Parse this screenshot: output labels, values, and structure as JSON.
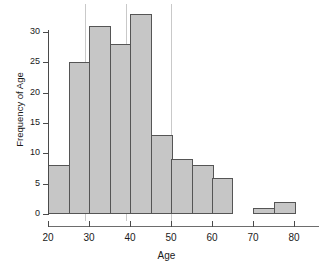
{
  "chart_data": {
    "type": "bar",
    "title": "",
    "subtitle": "",
    "xlabel": "Age",
    "ylabel": "Frequency of Age",
    "xlim": [
      20,
      80
    ],
    "ylim": [
      0,
      33
    ],
    "bin_width": 5,
    "grid": false,
    "legend": null,
    "bar_color": "#c6c6c6",
    "bar_edge_color": "#555555",
    "axis_color": "#4a4a4a",
    "gridline_color": "#c9c9c9",
    "categories": [
      "20-25",
      "25-30",
      "30-35",
      "35-40",
      "40-45",
      "45-50",
      "50-55",
      "55-60",
      "60-65",
      "65-70",
      "70-75",
      "75-80"
    ],
    "bin_edges": [
      20,
      25,
      30,
      35,
      40,
      45,
      50,
      55,
      60,
      65,
      70,
      75,
      80
    ],
    "values": [
      8,
      25,
      31,
      28,
      33,
      13,
      9,
      8,
      6,
      0,
      1,
      2
    ],
    "x_ticks": [
      20,
      30,
      40,
      50,
      60,
      70,
      80
    ],
    "x_tick_labels": [
      "20",
      "30",
      "40",
      "50",
      "60",
      "70",
      "80"
    ],
    "y_ticks": [
      0,
      5,
      10,
      15,
      20,
      25,
      30
    ],
    "y_tick_labels": [
      "0",
      "5",
      "10",
      "15",
      "20",
      "25",
      "30"
    ],
    "vertical_reference_lines": [
      29,
      39,
      50
    ]
  }
}
